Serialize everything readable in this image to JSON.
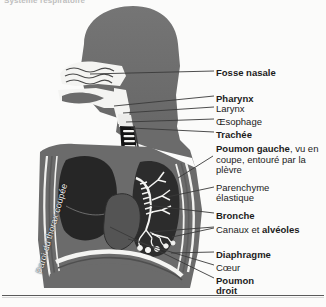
{
  "figure": {
    "heading": "Système respiratoire",
    "wall_caption": "Paroi du thorax coupée",
    "colors": {
      "background": "#fbfbfa",
      "body_gray": "#6e6e6e",
      "body_gray_dark": "#5f5f5f",
      "lung_dark": "#2a2a2a",
      "airway_white": "#f4f4f2",
      "heart_gray": "#555555",
      "leader_line": "#3a3a3a",
      "text": "#1c1c1c"
    },
    "labels": [
      {
        "id": "fosse-nasale",
        "text": "Fosse nasale",
        "bold": true,
        "x": 216,
        "y": 68
      },
      {
        "id": "pharynx",
        "text": "Pharynx",
        "bold": true,
        "x": 216,
        "y": 94
      },
      {
        "id": "larynx",
        "text": "Larynx",
        "bold": false,
        "x": 216,
        "y": 104
      },
      {
        "id": "oesophage",
        "text": "Œsophage",
        "bold": false,
        "x": 216,
        "y": 117
      },
      {
        "id": "trachee",
        "text": "Trachée",
        "bold": true,
        "x": 216,
        "y": 130
      },
      {
        "id": "parenchyme",
        "text": "Parenchyme",
        "bold": false,
        "x": 216,
        "y": 183
      },
      {
        "id": "elastique",
        "text": "élastique",
        "bold": false,
        "x": 216,
        "y": 193
      },
      {
        "id": "bronche",
        "text": "Bronche",
        "bold": true,
        "x": 216,
        "y": 211
      },
      {
        "id": "diaphragme",
        "text": "Diaphragme",
        "bold": true,
        "x": 216,
        "y": 250
      },
      {
        "id": "coeur",
        "text": "Cœur",
        "bold": false,
        "x": 216,
        "y": 263
      },
      {
        "id": "poumon-droit-1",
        "text": "Poumon",
        "bold": true,
        "x": 216,
        "y": 276
      },
      {
        "id": "poumon-droit-2",
        "text": "droit",
        "bold": true,
        "x": 216,
        "y": 286
      }
    ],
    "labels_rich": {
      "poumon_gauche": {
        "x": 216,
        "y": 144,
        "part_bold": "Poumon gauche",
        "part_plain": ", vu en coupe, entouré par la plèvre"
      },
      "canaux_alveoles": {
        "x": 216,
        "y": 225,
        "part_plain": "Canaux et ",
        "part_bold": "alvéoles"
      }
    },
    "leaders": [
      {
        "id": "leader-fosse-nasale",
        "x1": 90,
        "y1": 74,
        "x2": 214,
        "y2": 71
      },
      {
        "id": "leader-pharynx",
        "x1": 114,
        "y1": 106,
        "x2": 214,
        "y2": 96
      },
      {
        "id": "leader-larynx",
        "x1": 123,
        "y1": 113,
        "x2": 214,
        "y2": 107
      },
      {
        "id": "leader-oesophage",
        "x1": 126,
        "y1": 122,
        "x2": 214,
        "y2": 119
      },
      {
        "id": "leader-trachee",
        "x1": 131,
        "y1": 128,
        "x2": 214,
        "y2": 132
      },
      {
        "id": "leader-poumon-gauche",
        "x1": 178,
        "y1": 178,
        "x2": 213,
        "y2": 156
      },
      {
        "id": "leader-parenchyme",
        "x1": 167,
        "y1": 197,
        "x2": 214,
        "y2": 187
      },
      {
        "id": "leader-bronche",
        "x1": 146,
        "y1": 205,
        "x2": 214,
        "y2": 213
      },
      {
        "id": "leader-canaux",
        "x1": 150,
        "y1": 232,
        "x2": 214,
        "y2": 227
      },
      {
        "id": "leader-canaux-2",
        "x1": 172,
        "y1": 237,
        "x2": 214,
        "y2": 228
      },
      {
        "id": "leader-diaphragme",
        "x1": 171,
        "y1": 253,
        "x2": 214,
        "y2": 252
      },
      {
        "id": "leader-coeur",
        "x1": 128,
        "y1": 239,
        "x2": 214,
        "y2": 265
      },
      {
        "id": "leader-poumon-droit",
        "x1": 110,
        "y1": 227,
        "x2": 214,
        "y2": 278
      }
    ]
  }
}
